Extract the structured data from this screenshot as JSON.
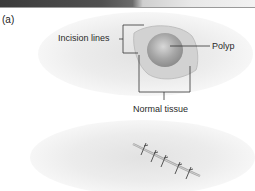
{
  "figure": {
    "panel_label": "(a)",
    "labels": {
      "incision_lines": "Incision lines",
      "polyp": "Polyp",
      "normal_tissue": "Normal tissue"
    },
    "colors": {
      "tissue_background": "#ececec",
      "normal_tissue": "#c8c8c8",
      "polyp": "#9a9a9a",
      "leader_lines": "#333333",
      "photo_strip_dark": "#3a3a3a"
    },
    "lower_illustration": "sutured-incision",
    "suture_count": 5
  }
}
